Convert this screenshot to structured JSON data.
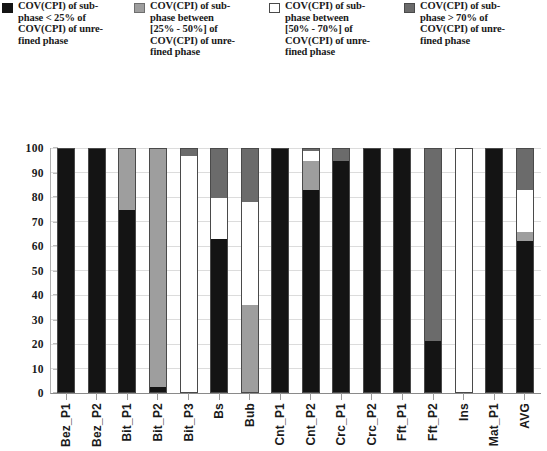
{
  "legend": {
    "position": "top",
    "items": [
      {
        "label": "COV(CPI) of sub-\nphase < 25% of\nCOV(CPI) of unre-\nfined phase",
        "color": "#141414",
        "border": "#141414",
        "key": "lt25"
      },
      {
        "label": "COV(CPI) of sub-\nphase between\n[25% - 50%] of\nCOV(CPI) of unre-\nfined phase",
        "color": "#9e9e9e",
        "border": "#6e6e6e",
        "key": "b2550"
      },
      {
        "label": "COV(CPI) of sub-\nphase between\n[50% - 70%] of\nCOV(CPI) of unre-\nfined phase",
        "color": "#ffffff",
        "border": "#4a4a4a",
        "key": "b5070"
      },
      {
        "label": "COV(CPI) of sub-\nphase > 70% of\nCOV(CPI) of unre-\nfined phase",
        "color": "#6b6b6b",
        "border": "#4a4a4a",
        "key": "gt70"
      }
    ]
  },
  "axes": {
    "y_ticks": [
      0,
      10,
      20,
      30,
      40,
      50,
      60,
      70,
      80,
      90,
      100
    ],
    "ylim": [
      0,
      100
    ],
    "ylabel": "",
    "xlabel": ""
  },
  "chart_data": {
    "type": "bar",
    "title": "",
    "subtitle": "",
    "xlabel": "",
    "ylabel": "",
    "ylim": [
      0,
      100
    ],
    "stacked": true,
    "grid": true,
    "legend_position": "top",
    "categories": [
      "Bez_P1",
      "Bez_P2",
      "Bit_P1",
      "Bit_P2",
      "Bit_P3",
      "Bs",
      "Bub",
      "Cnt_P1",
      "Cnt_P2",
      "Crc_P1",
      "Crc_P2",
      "Fft_P1",
      "Fft_P2",
      "Ins",
      "Mat_P1",
      "AVG"
    ],
    "series": [
      {
        "name": "COV(CPI) of subphase < 25% of COV(CPI) of unrefined phase",
        "key": "lt25",
        "color": "#141414",
        "values": [
          100,
          100,
          75,
          2,
          0,
          63,
          0,
          100,
          83,
          95,
          100,
          100,
          21,
          0,
          100,
          62
        ]
      },
      {
        "name": "COV(CPI) of subphase between [25% - 50%] of COV(CPI) of unrefined phase",
        "key": "b2550",
        "color": "#9e9e9e",
        "values": [
          0,
          0,
          25,
          98,
          0,
          0,
          36,
          0,
          12,
          0,
          0,
          0,
          0,
          0,
          0,
          4
        ]
      },
      {
        "name": "COV(CPI) of subphase between [50% - 70%] of COV(CPI) of unrefined phase",
        "key": "b5070",
        "color": "#ffffff",
        "values": [
          0,
          0,
          0,
          0,
          97,
          17,
          42,
          0,
          4,
          0,
          0,
          0,
          0,
          100,
          0,
          17
        ]
      },
      {
        "name": "COV(CPI) of subphase > 70% of COV(CPI) of unrefined phase",
        "key": "gt70",
        "color": "#6b6b6b",
        "values": [
          0,
          0,
          0,
          0,
          3,
          20,
          22,
          0,
          1,
          5,
          0,
          0,
          79,
          0,
          0,
          17
        ]
      }
    ]
  }
}
